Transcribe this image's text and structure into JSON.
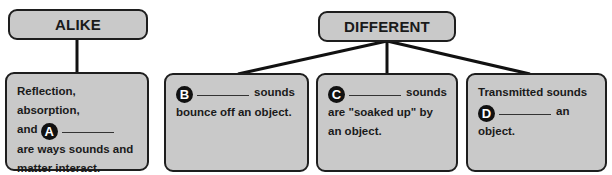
{
  "alike": {
    "header": "ALIKE",
    "box": {
      "line1": "Reflection, absorption,",
      "pre": "and",
      "badge": "A",
      "post": "are ways sounds and",
      "line4": "matter interact."
    }
  },
  "different": {
    "header": "DIFFERENT",
    "boxes": [
      {
        "badge": "B",
        "after_blank": "sounds",
        "rest": "bounce off an object."
      },
      {
        "badge": "C",
        "after_blank": "sounds",
        "rest": "are \"soaked up\" by an object."
      },
      {
        "pre": "Transmitted sounds",
        "badge": "D",
        "after_blank": "an",
        "rest": "object."
      }
    ]
  },
  "colors": {
    "box_fill": "#c9c9c9",
    "border": "#1e1e1e",
    "badge": "#111111"
  }
}
